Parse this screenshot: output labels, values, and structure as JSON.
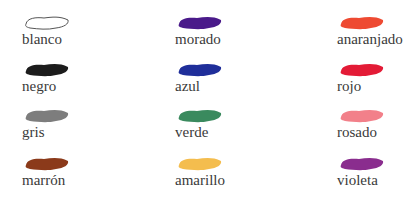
{
  "colors": [
    {
      "label": "blanco",
      "hex": "#ffffff",
      "outline": true,
      "col": 0,
      "row": 0
    },
    {
      "label": "negro",
      "hex": "#1c1c1c",
      "col": 0,
      "row": 1
    },
    {
      "label": "gris",
      "hex": "#7d7d7d",
      "col": 0,
      "row": 2
    },
    {
      "label": "marrón",
      "hex": "#8b3a1a",
      "col": 0,
      "row": 3
    },
    {
      "label": "morado",
      "hex": "#4a1a8a",
      "col": 1,
      "row": 0
    },
    {
      "label": "azul",
      "hex": "#1f2e9a",
      "col": 1,
      "row": 1
    },
    {
      "label": "verde",
      "hex": "#3a8a5e",
      "col": 1,
      "row": 2
    },
    {
      "label": "amarillo",
      "hex": "#f4bd4e",
      "col": 1,
      "row": 3
    },
    {
      "label": "anaranjado",
      "hex": "#ee4a32",
      "col": 2,
      "row": 0
    },
    {
      "label": "rojo",
      "hex": "#e31b36",
      "col": 2,
      "row": 1
    },
    {
      "label": "rosado",
      "hex": "#f2808a",
      "col": 2,
      "row": 2
    },
    {
      "label": "violeta",
      "hex": "#8a2d8e",
      "col": 2,
      "row": 3
    }
  ]
}
